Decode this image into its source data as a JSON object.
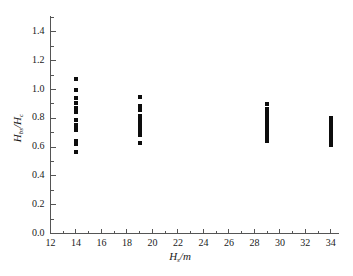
{
  "chart_data": {
    "type": "scatter",
    "title": "",
    "subtitle": "",
    "xlabel": "H_s /m",
    "xlabel_main": "H",
    "xlabel_sub": "s",
    "xlabel_unit": "/m",
    "ylabel": "H_bs /H_c",
    "ylabel_num_main": "H",
    "ylabel_num_sub": "bs",
    "ylabel_slash": "/",
    "ylabel_den_main": "H",
    "ylabel_den_sub": "c",
    "xlim": [
      12,
      34.6
    ],
    "ylim": [
      0.0,
      1.5
    ],
    "xticks": [
      12,
      14,
      16,
      18,
      20,
      22,
      24,
      26,
      28,
      30,
      32,
      34
    ],
    "xtick_labels": [
      "12",
      "14",
      "16",
      "18",
      "20",
      "22",
      "24",
      "26",
      "28",
      "30",
      "32",
      "34"
    ],
    "yticks": [
      0.0,
      0.2,
      0.4,
      0.6,
      0.8,
      1.0,
      1.2,
      1.4
    ],
    "ytick_labels": [
      "0.0",
      "0.2",
      "0.4",
      "0.6",
      "0.8",
      "1.0",
      "1.2",
      "1.4"
    ],
    "x_minor_tick_step": 1,
    "y_minor_tick_step": 0.1,
    "grid": false,
    "legend": false,
    "legend_position": "none",
    "marker": "square",
    "marker_size_px": 4,
    "marker_color": "#0d0d0d",
    "axis_color": "#555555",
    "background_color": "#ffffff",
    "series": [
      {
        "name": "Hbs/Hc vs Hs",
        "color": "#0d0d0d",
        "points": [
          [
            14,
            1.07
          ],
          [
            14,
            0.995
          ],
          [
            14,
            0.94
          ],
          [
            14,
            0.905
          ],
          [
            14,
            0.875
          ],
          [
            14,
            0.845
          ],
          [
            14,
            0.785
          ],
          [
            14,
            0.755
          ],
          [
            14,
            0.74
          ],
          [
            14,
            0.72
          ],
          [
            14,
            0.645
          ],
          [
            14,
            0.625
          ],
          [
            14,
            0.565
          ],
          [
            19,
            0.945
          ],
          [
            19,
            0.885
          ],
          [
            19,
            0.855
          ],
          [
            19,
            0.815
          ],
          [
            19,
            0.795
          ],
          [
            19,
            0.775
          ],
          [
            19,
            0.755
          ],
          [
            19,
            0.735
          ],
          [
            19,
            0.715
          ],
          [
            19,
            0.685
          ],
          [
            19,
            0.63
          ],
          [
            29,
            0.9
          ],
          [
            29,
            0.865
          ],
          [
            29,
            0.845
          ],
          [
            29,
            0.825
          ],
          [
            29,
            0.805
          ],
          [
            29,
            0.79
          ],
          [
            29,
            0.775
          ],
          [
            29,
            0.76
          ],
          [
            29,
            0.745
          ],
          [
            29,
            0.73
          ],
          [
            29,
            0.715
          ],
          [
            29,
            0.7
          ],
          [
            29,
            0.685
          ],
          [
            29,
            0.67
          ],
          [
            29,
            0.655
          ],
          [
            29,
            0.645
          ],
          [
            34,
            0.805
          ],
          [
            34,
            0.785
          ],
          [
            34,
            0.765
          ],
          [
            34,
            0.745
          ],
          [
            34,
            0.725
          ],
          [
            34,
            0.705
          ],
          [
            34,
            0.685
          ],
          [
            34,
            0.665
          ],
          [
            34,
            0.645
          ],
          [
            34,
            0.615
          ]
        ]
      }
    ]
  }
}
